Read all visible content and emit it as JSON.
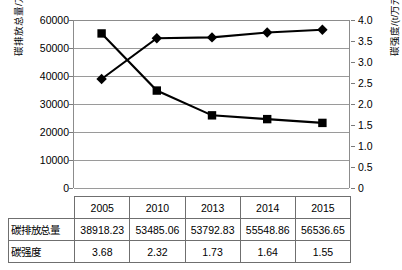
{
  "chart_data": {
    "type": "line",
    "title": "",
    "xlabel": "",
    "categories": [
      "2005",
      "2010",
      "2013",
      "2014",
      "2015"
    ],
    "grid": true,
    "legend": "none",
    "series": [
      {
        "name": "碳排放总量",
        "marker": "diamond",
        "axis": "left",
        "unit": "万t",
        "values": [
          38918.23,
          53485.06,
          53792.83,
          55548.86,
          56536.65
        ]
      },
      {
        "name": "碳强度",
        "marker": "square",
        "axis": "right",
        "unit": "t/万元",
        "values": [
          3.68,
          2.32,
          1.73,
          1.64,
          1.55
        ]
      }
    ],
    "left_axis": {
      "label": "碳排放总量/万t",
      "ticks": [
        "60000",
        "50000",
        "40000",
        "30000",
        "20000",
        "10000",
        "0"
      ],
      "min": 0,
      "max": 60000,
      "step": 10000
    },
    "right_axis": {
      "label": "碳强度/(t/万元)",
      "ticks": [
        "4.0",
        "3.5",
        "3.0",
        "2.5",
        "2.0",
        "1.5",
        "1.0",
        "0.5",
        "0"
      ],
      "min": 0,
      "max": 4.0,
      "step": 0.5
    }
  },
  "table": {
    "header": [
      "",
      "2005",
      "2010",
      "2013",
      "2014",
      "2015"
    ],
    "rows": [
      {
        "label": "碳排放总量",
        "cells": [
          "38918.23",
          "53485.06",
          "53792.83",
          "55548.86",
          "56536.65"
        ]
      },
      {
        "label": "碳强度",
        "cells": [
          "3.68",
          "2.32",
          "1.73",
          "1.64",
          "1.55"
        ]
      }
    ]
  },
  "colors": {
    "series": "#000000",
    "gridline": "#9a9a9a",
    "axis": "#8c8c8c",
    "table_border": "#6f6f6f",
    "background": "#ffffff"
  }
}
